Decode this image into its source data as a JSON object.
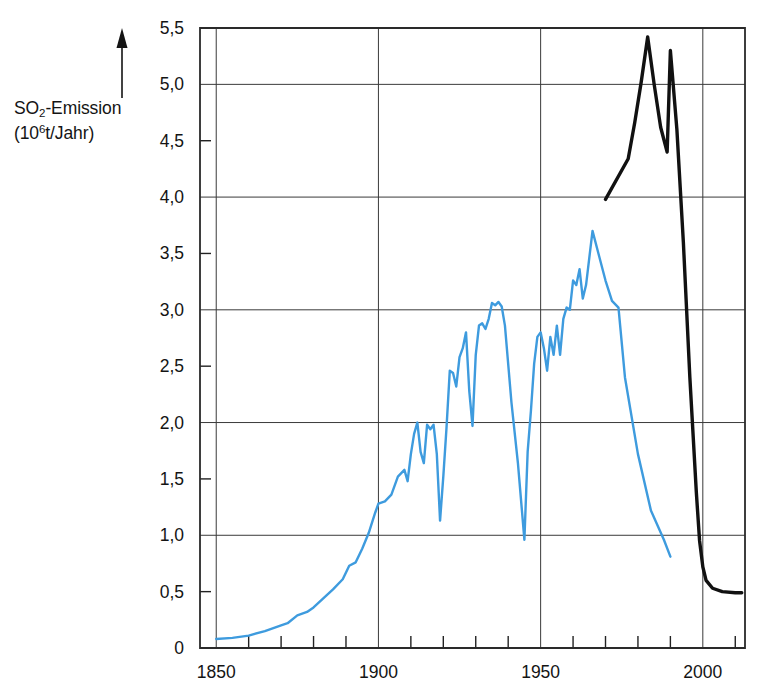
{
  "chart_data": {
    "type": "line",
    "title": "",
    "xlabel": "",
    "ylabel": "SO2-Emission (10^6 t/Jahr)",
    "ylabel_parts": {
      "line1_pre": "SO",
      "line1_sub": "2",
      "line1_post": "-Emission",
      "line2_pre": "(10",
      "line2_sup": "6",
      "line2_post": "t/Jahr)"
    },
    "xlim": [
      1845,
      2013
    ],
    "ylim": [
      0,
      5.5
    ],
    "grid": true,
    "grid_x_values": [
      1850,
      1900,
      1950,
      2000
    ],
    "grid_y_values": [
      1.0,
      2.0,
      3.0,
      4.0,
      5.0
    ],
    "x_major_ticks": [
      1850,
      1900,
      1950,
      2000
    ],
    "x_minor_tick_step": 10,
    "y_major_ticks": [
      0,
      0.5,
      1.0,
      1.5,
      2.0,
      2.5,
      3.0,
      3.5,
      4.0,
      4.5,
      5.0,
      5.5
    ],
    "xtick_labels": [
      "1850",
      "1900",
      "1950",
      "2000"
    ],
    "ytick_labels": [
      "0",
      "0,5",
      "1,0",
      "1,5",
      "2,0",
      "2,5",
      "3,0",
      "3,5",
      "4,0",
      "4,5",
      "5,0",
      "5,5"
    ],
    "axis_arrow": "upward-arrow",
    "legend": [],
    "series": [
      {
        "name": "blue-curve",
        "color": "#3E9BDE",
        "width": 2.4,
        "points": [
          [
            1850,
            0.08
          ],
          [
            1855,
            0.09
          ],
          [
            1860,
            0.11
          ],
          [
            1865,
            0.15
          ],
          [
            1870,
            0.2
          ],
          [
            1872,
            0.22
          ],
          [
            1875,
            0.29
          ],
          [
            1878,
            0.32
          ],
          [
            1880,
            0.36
          ],
          [
            1883,
            0.44
          ],
          [
            1886,
            0.52
          ],
          [
            1889,
            0.61
          ],
          [
            1891,
            0.73
          ],
          [
            1893,
            0.76
          ],
          [
            1895,
            0.88
          ],
          [
            1897,
            1.02
          ],
          [
            1899,
            1.2
          ],
          [
            1900,
            1.28
          ],
          [
            1902,
            1.3
          ],
          [
            1904,
            1.36
          ],
          [
            1906,
            1.52
          ],
          [
            1908,
            1.58
          ],
          [
            1909,
            1.48
          ],
          [
            1910,
            1.72
          ],
          [
            1911,
            1.9
          ],
          [
            1912,
            2.0
          ],
          [
            1913,
            1.74
          ],
          [
            1914,
            1.64
          ],
          [
            1915,
            1.98
          ],
          [
            1916,
            1.94
          ],
          [
            1917,
            1.98
          ],
          [
            1918,
            1.72
          ],
          [
            1919,
            1.13
          ],
          [
            1920,
            1.52
          ],
          [
            1921,
            1.96
          ],
          [
            1922,
            2.46
          ],
          [
            1923,
            2.44
          ],
          [
            1924,
            2.32
          ],
          [
            1925,
            2.58
          ],
          [
            1926,
            2.66
          ],
          [
            1927,
            2.8
          ],
          [
            1928,
            2.28
          ],
          [
            1929,
            1.97
          ],
          [
            1930,
            2.6
          ],
          [
            1931,
            2.86
          ],
          [
            1932,
            2.88
          ],
          [
            1933,
            2.83
          ],
          [
            1934,
            2.92
          ],
          [
            1935,
            3.06
          ],
          [
            1936,
            3.04
          ],
          [
            1937,
            3.07
          ],
          [
            1938,
            3.03
          ],
          [
            1939,
            2.86
          ],
          [
            1941,
            2.18
          ],
          [
            1943,
            1.64
          ],
          [
            1945,
            0.96
          ],
          [
            1946,
            1.74
          ],
          [
            1947,
            2.1
          ],
          [
            1948,
            2.52
          ],
          [
            1949,
            2.76
          ],
          [
            1950,
            2.8
          ],
          [
            1951,
            2.66
          ],
          [
            1952,
            2.46
          ],
          [
            1953,
            2.76
          ],
          [
            1954,
            2.6
          ],
          [
            1955,
            2.86
          ],
          [
            1956,
            2.6
          ],
          [
            1957,
            2.92
          ],
          [
            1958,
            3.02
          ],
          [
            1959,
            3.0
          ],
          [
            1960,
            3.26
          ],
          [
            1961,
            3.22
          ],
          [
            1962,
            3.36
          ],
          [
            1963,
            3.1
          ],
          [
            1964,
            3.22
          ],
          [
            1965,
            3.46
          ],
          [
            1966,
            3.7
          ],
          [
            1968,
            3.48
          ],
          [
            1970,
            3.26
          ],
          [
            1972,
            3.08
          ],
          [
            1974,
            3.02
          ],
          [
            1976,
            2.4
          ],
          [
            1980,
            1.72
          ],
          [
            1984,
            1.22
          ],
          [
            1988,
            0.96
          ],
          [
            1990,
            0.81
          ]
        ]
      },
      {
        "name": "black-curve",
        "color": "#111111",
        "width": 3.4,
        "points": [
          [
            1970,
            3.98
          ],
          [
            1977,
            4.34
          ],
          [
            1979,
            4.66
          ],
          [
            1981,
            5.02
          ],
          [
            1983,
            5.42
          ],
          [
            1985,
            5.0
          ],
          [
            1987,
            4.62
          ],
          [
            1989,
            4.4
          ],
          [
            1990,
            5.3
          ],
          [
            1992,
            4.6
          ],
          [
            1994,
            3.6
          ],
          [
            1996,
            2.4
          ],
          [
            1998,
            1.38
          ],
          [
            1999,
            0.95
          ],
          [
            2000,
            0.72
          ],
          [
            2001,
            0.6
          ],
          [
            2003,
            0.53
          ],
          [
            2006,
            0.5
          ],
          [
            2010,
            0.49
          ],
          [
            2012,
            0.49
          ]
        ]
      }
    ]
  }
}
